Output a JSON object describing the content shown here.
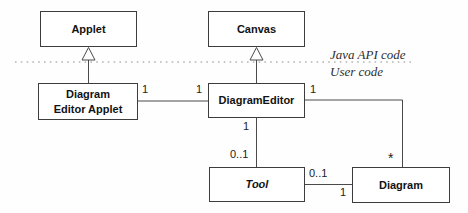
{
  "diagram": {
    "kind": "uml-class-diagram",
    "classes": {
      "applet": {
        "name": "Applet"
      },
      "canvas": {
        "name": "Canvas"
      },
      "diagram_editor_applet": {
        "name": "Diagram\nEditor Applet"
      },
      "diagram_editor": {
        "name": "DiagramEditor"
      },
      "tool": {
        "name": "Tool"
      },
      "diagram": {
        "name": "Diagram"
      }
    },
    "region_labels": {
      "api": "Java API code",
      "user": "User code"
    },
    "multiplicities": {
      "applet_editor_end": "1",
      "editor_left_end": "1",
      "editor_right_end": "1",
      "editor_bottom_end": "1",
      "tool_top_end": "0..1",
      "tool_right_end": "0..1",
      "diagram_top_end": "*",
      "diagram_left_end": "1"
    },
    "relationships": [
      {
        "type": "generalization",
        "from": "Diagram Editor Applet",
        "to": "Applet"
      },
      {
        "type": "generalization",
        "from": "DiagramEditor",
        "to": "Canvas"
      },
      {
        "type": "association",
        "from": "Diagram Editor Applet",
        "from_mult": "1",
        "to": "DiagramEditor",
        "to_mult": "1"
      },
      {
        "type": "association",
        "from": "DiagramEditor",
        "from_mult": "1",
        "to": "Diagram",
        "to_mult": "*"
      },
      {
        "type": "association",
        "from": "DiagramEditor",
        "from_mult": "1",
        "to": "Tool",
        "to_mult": "0..1"
      },
      {
        "type": "association",
        "from": "Tool",
        "from_mult": "0..1",
        "to": "Diagram",
        "to_mult": "1"
      }
    ],
    "colors": {
      "line": "#4a4a4a",
      "box_border": "#3d3d3d",
      "text": "#121212",
      "divider": "#909090",
      "background": "#ffffff"
    }
  }
}
